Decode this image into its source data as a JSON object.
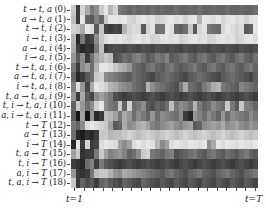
{
  "chart_data": {
    "type": "heatmap",
    "title": "",
    "xlabel": "",
    "ylabel": "",
    "x_tick_labels": {
      "start": "t=1",
      "end": "t=T"
    },
    "colormap": "grayscale (dark = high, light = low)",
    "rows": [
      {
        "label": "t → t, a",
        "index": "(0)"
      },
      {
        "label": "a → t, a",
        "index": "(1)"
      },
      {
        "label": "t → t, i",
        "index": "(2)"
      },
      {
        "label": "i → t, i",
        "index": "(3)"
      },
      {
        "label": "a → a, i",
        "index": "(4)"
      },
      {
        "label": "i → a, i",
        "index": "(5)"
      },
      {
        "label": "t → t, a, i",
        "index": "(6)"
      },
      {
        "label": "a → t, a, i",
        "index": "(7)"
      },
      {
        "label": "i → t, a, i",
        "index": "(8)"
      },
      {
        "label": "t, a → t, a, i",
        "index": "(9)"
      },
      {
        "label": "t, i → t, a, i",
        "index": "(10)"
      },
      {
        "label": "a, i → t, a, i",
        "index": "(11)"
      },
      {
        "label": "t → T",
        "index": "(12)"
      },
      {
        "label": "a → T",
        "index": "(13)"
      },
      {
        "label": "i → T",
        "index": "(14)"
      },
      {
        "label": "t, a → T",
        "index": "(15)"
      },
      {
        "label": "t, i → T",
        "index": "(16)"
      },
      {
        "label": "a, i → T",
        "index": "(17)"
      },
      {
        "label": "t, a, i → T",
        "index": "(18)"
      }
    ],
    "num_columns": 40,
    "values": [
      [
        200,
        60,
        210,
        170,
        120,
        140,
        200,
        230,
        180,
        210,
        120,
        110,
        100,
        110,
        100,
        105,
        100,
        110,
        100,
        105,
        100,
        100,
        110,
        100,
        100,
        105,
        100,
        110,
        100,
        100,
        105,
        100,
        100,
        110,
        100,
        100,
        105,
        100,
        100,
        110
      ],
      [
        190,
        60,
        230,
        100,
        90,
        130,
        100,
        200,
        230,
        230,
        225,
        230,
        215,
        210,
        225,
        230,
        220,
        225,
        210,
        215,
        225,
        230,
        220,
        225,
        210,
        225,
        230,
        180,
        230,
        225,
        220,
        230,
        215,
        225,
        230,
        220,
        225,
        210,
        225,
        230
      ],
      [
        210,
        200,
        170,
        230,
        220,
        90,
        200,
        70,
        60,
        70,
        65,
        180,
        210,
        220,
        215,
        90,
        210,
        225,
        110,
        115,
        230,
        220,
        100,
        95,
        110,
        200,
        90,
        215,
        225,
        120,
        110,
        105,
        215,
        230,
        220,
        210,
        220,
        90,
        100,
        230
      ],
      [
        180,
        40,
        120,
        60,
        70,
        140,
        200,
        220,
        230,
        225,
        230,
        220,
        215,
        225,
        230,
        220,
        225,
        210,
        215,
        225,
        230,
        220,
        225,
        210,
        215,
        225,
        230,
        220,
        225,
        210,
        215,
        225,
        230,
        220,
        225,
        210,
        215,
        225,
        230,
        220
      ],
      [
        170,
        60,
        40,
        50,
        45,
        120,
        190,
        60,
        70,
        80,
        75,
        70,
        80,
        75,
        70,
        80,
        75,
        70,
        80,
        75,
        70,
        80,
        75,
        70,
        80,
        75,
        70,
        80,
        75,
        70,
        80,
        75,
        70,
        80,
        75,
        70,
        80,
        75,
        70,
        80
      ],
      [
        150,
        90,
        140,
        60,
        110,
        160,
        180,
        200,
        190,
        80,
        90,
        110,
        100,
        120,
        130,
        110,
        90,
        100,
        120,
        110,
        130,
        90,
        100,
        110,
        120,
        100,
        90,
        110,
        120,
        100,
        90,
        110,
        120,
        100,
        90,
        110,
        120,
        100,
        90,
        110
      ],
      [
        120,
        60,
        140,
        160,
        110,
        180,
        230,
        230,
        220,
        200,
        180,
        170,
        150,
        110,
        100,
        90,
        110,
        120,
        100,
        90,
        110,
        120,
        100,
        90,
        100,
        110,
        120,
        100,
        90,
        110,
        120,
        100,
        90,
        110,
        120,
        100,
        90,
        110,
        120,
        100
      ],
      [
        100,
        40,
        60,
        90,
        110,
        200,
        210,
        140,
        130,
        120,
        110,
        100,
        90,
        110,
        100,
        90,
        80,
        70,
        90,
        100,
        110,
        100,
        90,
        80,
        70,
        90,
        100,
        110,
        100,
        90,
        80,
        70,
        90,
        100,
        110,
        100,
        90,
        80,
        70,
        90
      ],
      [
        130,
        220,
        150,
        70,
        170,
        230,
        220,
        210,
        180,
        170,
        150,
        140,
        130,
        110,
        100,
        90,
        180,
        140,
        120,
        110,
        100,
        90,
        80,
        120,
        170,
        110,
        100,
        90,
        120,
        140,
        170,
        180,
        120,
        110,
        100,
        90,
        130,
        120,
        110,
        100
      ],
      [
        150,
        60,
        170,
        90,
        70,
        140,
        160,
        140,
        120,
        80,
        70,
        60,
        70,
        80,
        70,
        60,
        70,
        80,
        70,
        60,
        70,
        80,
        70,
        60,
        70,
        80,
        70,
        60,
        70,
        80,
        70,
        60,
        70,
        80,
        70,
        60,
        70,
        80,
        70,
        60
      ],
      [
        100,
        200,
        150,
        110,
        140,
        210,
        230,
        140,
        120,
        110,
        200,
        100,
        210,
        110,
        120,
        140,
        90,
        80,
        100,
        90,
        110,
        190,
        120,
        140,
        130,
        110,
        180,
        120,
        100,
        110,
        140,
        120,
        110,
        200,
        120,
        90,
        200,
        130,
        120,
        100
      ],
      [
        90,
        20,
        160,
        20,
        150,
        40,
        60,
        190,
        180,
        160,
        120,
        170,
        150,
        110,
        140,
        120,
        100,
        150,
        110,
        140,
        130,
        120,
        110,
        140,
        60,
        40,
        150,
        130,
        110,
        140,
        120,
        100,
        150,
        110,
        140,
        130,
        120,
        110,
        140,
        120
      ],
      [
        120,
        100,
        140,
        220,
        230,
        220,
        210,
        200,
        160,
        90,
        100,
        170,
        140,
        150,
        170,
        180,
        160,
        130,
        120,
        140,
        150,
        160,
        140,
        130,
        150,
        160,
        90,
        100,
        140,
        150,
        160,
        150,
        170,
        140,
        150,
        160,
        140,
        130,
        150,
        140
      ],
      [
        110,
        40,
        30,
        50,
        40,
        60,
        200,
        200,
        180,
        190,
        190,
        200,
        210,
        200,
        190,
        200,
        210,
        200,
        190,
        200,
        210,
        200,
        190,
        200,
        210,
        200,
        190,
        200,
        210,
        200,
        190,
        200,
        210,
        200,
        190,
        200,
        210,
        200,
        190,
        200
      ],
      [
        40,
        230,
        60,
        210,
        60,
        70,
        220,
        230,
        225,
        220,
        160,
        140,
        160,
        220,
        230,
        220,
        230,
        225,
        180,
        140,
        160,
        220,
        230,
        225,
        220,
        230,
        225,
        220,
        230,
        140,
        170,
        230,
        220,
        230,
        225,
        220,
        230,
        225,
        220,
        230
      ],
      [
        160,
        200,
        50,
        60,
        60,
        120,
        200,
        160,
        130,
        140,
        150,
        130,
        100,
        110,
        140,
        200,
        210,
        120,
        110,
        100,
        120,
        130,
        80,
        90,
        100,
        110,
        120,
        100,
        90,
        110,
        120,
        100,
        90,
        110,
        100,
        90,
        110,
        120,
        100,
        90
      ],
      [
        60,
        50,
        40,
        110,
        130,
        60,
        120,
        90,
        80,
        70,
        60,
        70,
        80,
        70,
        60,
        70,
        80,
        70,
        60,
        70,
        80,
        70,
        60,
        70,
        80,
        70,
        60,
        70,
        80,
        70,
        60,
        70,
        80,
        70,
        60,
        70,
        80,
        70,
        60,
        70
      ],
      [
        150,
        60,
        50,
        60,
        120,
        190,
        200,
        200,
        180,
        150,
        140,
        170,
        160,
        150,
        140,
        130,
        120,
        110,
        100,
        90,
        110,
        120,
        100,
        90,
        80,
        100,
        110,
        120,
        100,
        90,
        80,
        100,
        110,
        120,
        100,
        90,
        80,
        100,
        110,
        120
      ],
      [
        200,
        60,
        100,
        80,
        90,
        60,
        100,
        110,
        90,
        80,
        70,
        100,
        90,
        80,
        70,
        100,
        90,
        80,
        70,
        90,
        80,
        70,
        90,
        80,
        70,
        90,
        80,
        70,
        90,
        80,
        70,
        90,
        80,
        70,
        90,
        80,
        70,
        90,
        80,
        70
      ]
    ]
  },
  "axis": {
    "x_start_label": "t=1",
    "x_end_label": "t=T"
  }
}
